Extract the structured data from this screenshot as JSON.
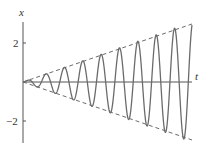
{
  "chart_data": {
    "type": "line",
    "title": "",
    "xlabel": "t",
    "ylabel": "x",
    "yticks": [
      2,
      -2
    ],
    "ytick_labels": [
      "2",
      "−2"
    ],
    "xlim": [
      0,
      9.2
    ],
    "ylim": [
      -3.4,
      3.6
    ],
    "grid": false,
    "legend": [],
    "series": [
      {
        "name": "x(t) = (t/3)·sin(2πt)",
        "style": "solid",
        "color": "#6b6b6b",
        "description": "Oscillation with linearly growing amplitude (resonance)",
        "peaks_t": [
          0.25,
          1.25,
          2.25,
          3.25,
          4.25,
          5.25,
          6.25,
          7.25,
          8.25
        ],
        "peaks_x": [
          0.08,
          0.42,
          0.75,
          1.08,
          1.42,
          1.75,
          2.08,
          2.42,
          2.75
        ],
        "troughs_t": [
          0.75,
          1.75,
          2.75,
          3.75,
          4.75,
          5.75,
          6.75,
          7.75,
          8.75
        ],
        "troughs_x": [
          -0.25,
          -0.58,
          -0.92,
          -1.25,
          -1.58,
          -1.92,
          -2.25,
          -2.58,
          -2.92
        ]
      },
      {
        "name": "upper envelope x = t/3",
        "style": "dashed",
        "color": "#6b6b6b",
        "x": [
          0,
          9.2
        ],
        "y": [
          0,
          3.07
        ]
      },
      {
        "name": "lower envelope x = -t/3",
        "style": "dashed",
        "color": "#6b6b6b",
        "x": [
          0,
          9.2
        ],
        "y": [
          0,
          -3.07
        ]
      }
    ]
  },
  "labels": {
    "y_axis": "x",
    "x_axis": "t",
    "tick_pos": "2",
    "tick_neg": "−2"
  },
  "colors": {
    "curve": "#6b6b6b",
    "axis": "#555555",
    "text": "#333333"
  }
}
